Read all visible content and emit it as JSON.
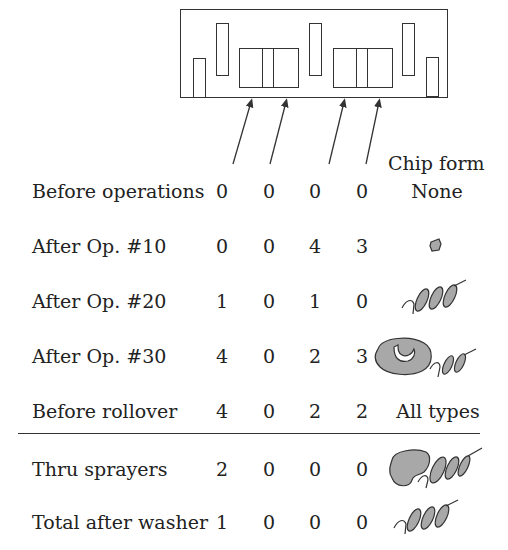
{
  "diagram": {
    "part_outline": "block-with-cavities",
    "arrow_count": 4
  },
  "table": {
    "header": {
      "chip_form": "Chip form"
    },
    "rows": [
      {
        "label": "Before operations",
        "values": [
          "0",
          "0",
          "0",
          "0"
        ],
        "chip_form": "None",
        "chip_icon": null
      },
      {
        "label": "After Op. #10",
        "values": [
          "0",
          "0",
          "4",
          "3"
        ],
        "chip_form": "",
        "chip_icon": "small-chip-icon"
      },
      {
        "label": "After Op. #20",
        "values": [
          "1",
          "0",
          "1",
          "0"
        ],
        "chip_form": "",
        "chip_icon": "spiral-chip-icon"
      },
      {
        "label": "After Op. #30",
        "values": [
          "4",
          "0",
          "2",
          "3"
        ],
        "chip_form": "",
        "chip_icon": "curl-and-spiral-chip-icon"
      },
      {
        "label": "Before rollover",
        "values": [
          "4",
          "0",
          "2",
          "2"
        ],
        "chip_form": "All types",
        "chip_icon": null
      },
      {
        "label": "Thru sprayers",
        "values": [
          "2",
          "0",
          "0",
          "0"
        ],
        "chip_form": "",
        "chip_icon": "curl-and-spiral-chip-icon"
      },
      {
        "label": "Total after washer",
        "values": [
          "1",
          "0",
          "0",
          "0"
        ],
        "chip_form": "",
        "chip_icon": "spiral-chip-icon"
      }
    ]
  },
  "colors": {
    "line": "#333333",
    "chip_fill": "#a8a8a8"
  }
}
